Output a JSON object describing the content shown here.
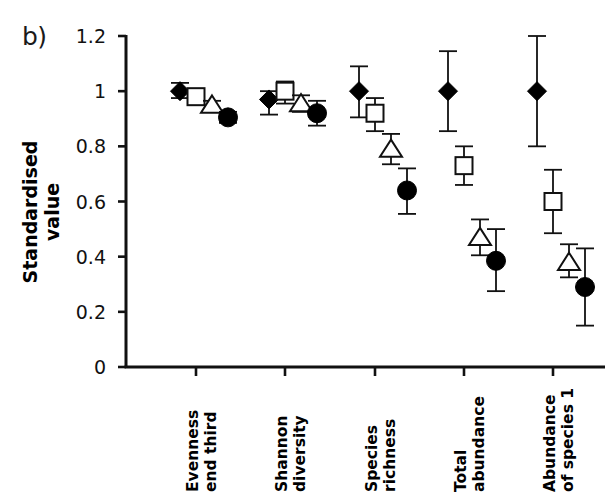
{
  "panel": {
    "label": "b)"
  },
  "axes": {
    "y_title": "Standardised value",
    "y_ticks": [
      "0",
      "0.2",
      "0.4",
      "0.6",
      "0.8",
      "1",
      "1.2"
    ],
    "x_ticks": [
      {
        "line1": "Evenness",
        "line2": "end third"
      },
      {
        "line1": "Shannon",
        "line2": "diversity"
      },
      {
        "line1": "Species",
        "line2": "richness"
      },
      {
        "line1": "Total",
        "line2": "abundance"
      },
      {
        "line1": "Abundance",
        "line2": "of species 1"
      }
    ]
  },
  "colors": {
    "axis": "#111111",
    "marker_fill": "#000000",
    "marker_open": "#ffffff",
    "error_bar": "#111111"
  },
  "chart_data": {
    "type": "scatter",
    "title": "",
    "xlabel": "",
    "ylabel": "Standardised value",
    "ylim": [
      0,
      1.2
    ],
    "yticks": [
      0,
      0.2,
      0.4,
      0.6,
      0.8,
      1.0,
      1.2
    ],
    "grid": false,
    "legend": "none",
    "categories": [
      "Evenness end third",
      "Shannon diversity",
      "Species richness",
      "Total abundance",
      "Abundance of species 1"
    ],
    "series": [
      {
        "name": "filled-diamond",
        "marker": "diamond-filled",
        "values": [
          1.0,
          0.97,
          1.0,
          1.0,
          1.0
        ],
        "err_low": [
          0.975,
          0.915,
          0.905,
          0.855,
          0.8
        ],
        "err_high": [
          1.03,
          1.0,
          1.09,
          1.145,
          1.2
        ]
      },
      {
        "name": "open-square",
        "marker": "square-open",
        "values": [
          0.98,
          1.0,
          0.92,
          0.73,
          0.6
        ],
        "err_low": [
          0.955,
          0.955,
          0.855,
          0.66,
          0.485
        ],
        "err_high": [
          1.005,
          1.035,
          0.975,
          0.8,
          0.715
        ]
      },
      {
        "name": "open-triangle",
        "marker": "triangle-open",
        "values": [
          0.95,
          0.955,
          0.79,
          0.47,
          0.38
        ],
        "err_low": [
          0.935,
          0.925,
          0.735,
          0.405,
          0.325
        ],
        "err_high": [
          0.965,
          0.985,
          0.845,
          0.535,
          0.445
        ]
      },
      {
        "name": "filled-circle",
        "marker": "circle-filled",
        "values": [
          0.905,
          0.92,
          0.64,
          0.385,
          0.29
        ],
        "err_low": [
          0.885,
          0.875,
          0.555,
          0.275,
          0.15
        ],
        "err_high": [
          0.925,
          0.965,
          0.72,
          0.5,
          0.43
        ]
      }
    ]
  }
}
